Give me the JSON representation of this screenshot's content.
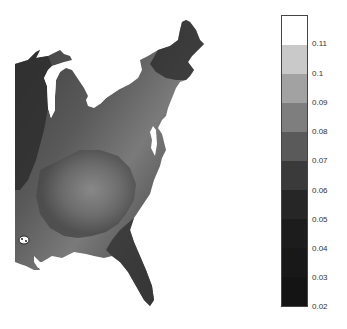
{
  "map": {
    "region": "Eastern United States",
    "colormap": "grayscale",
    "value_range": [
      0.02,
      0.12
    ]
  },
  "colorbar": {
    "min": 0.02,
    "max": 0.12,
    "bands": [
      {
        "from": 0.11,
        "to": 0.12,
        "color": "#ffffff"
      },
      {
        "from": 0.1,
        "to": 0.11,
        "color": "#c9c9c9"
      },
      {
        "from": 0.09,
        "to": 0.1,
        "color": "#a2a2a2"
      },
      {
        "from": 0.08,
        "to": 0.09,
        "color": "#7e7e7e"
      },
      {
        "from": 0.07,
        "to": 0.08,
        "color": "#5a5a5a"
      },
      {
        "from": 0.06,
        "to": 0.07,
        "color": "#3a3a3a"
      },
      {
        "from": 0.05,
        "to": 0.06,
        "color": "#262626"
      },
      {
        "from": 0.04,
        "to": 0.05,
        "color": "#1c1c1c"
      },
      {
        "from": 0.03,
        "to": 0.04,
        "color": "#181818"
      },
      {
        "from": 0.02,
        "to": 0.03,
        "color": "#141414"
      }
    ],
    "ticks": [
      {
        "label": "0.11",
        "y": 44
      },
      {
        "label": "0.1",
        "y": 74
      },
      {
        "label": "0.09",
        "y": 103
      },
      {
        "label": "0.08",
        "y": 132
      },
      {
        "label": "0.07",
        "y": 161
      },
      {
        "label": "0.06",
        "y": 191
      },
      {
        "label": "0.05",
        "y": 220
      },
      {
        "label": "0.04",
        "y": 249
      },
      {
        "label": "0.03",
        "y": 278
      },
      {
        "label": "0.02",
        "y": 307
      }
    ]
  }
}
